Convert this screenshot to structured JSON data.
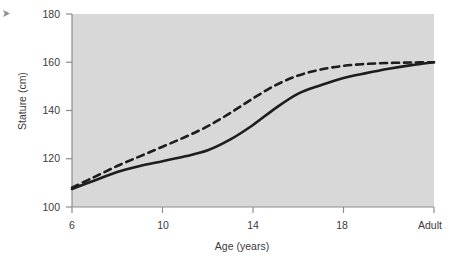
{
  "figure": {
    "corner_marker": "triangle-marker",
    "background_color": "#ffffff",
    "plot_background_color": "#d8d8d8",
    "axis_color": "#8d8d8d",
    "line_color": "#1d1d1d"
  },
  "chart_data": {
    "type": "line",
    "title": "",
    "xlabel": "Age (years)",
    "ylabel": "Stature (cm)",
    "xtick_labels": [
      "6",
      "10",
      "14",
      "18",
      "Adult"
    ],
    "xtick_values": [
      6,
      10,
      14,
      18,
      22
    ],
    "ytick_labels": [
      "100",
      "120",
      "140",
      "160",
      "180"
    ],
    "ytick_values": [
      100,
      120,
      140,
      160,
      180
    ],
    "xlim": [
      6,
      22
    ],
    "ylim": [
      100,
      180
    ],
    "grid": false,
    "legend_position": "inline-annotations",
    "series": [
      {
        "name": "Sea level",
        "style": "dashed",
        "label_position": {
          "x": 176,
          "y": 88
        },
        "x": [
          6,
          7,
          8,
          9,
          10,
          11,
          12,
          13,
          14,
          15,
          16,
          17,
          18,
          19,
          20,
          21,
          22
        ],
        "values": [
          108.0,
          112.5,
          117.0,
          121.0,
          125.0,
          129.0,
          133.5,
          139.0,
          145.0,
          150.5,
          154.5,
          157.0,
          158.5,
          159.3,
          159.7,
          159.9,
          160.0
        ]
      },
      {
        "name": "High altitude",
        "style": "solid",
        "label_position": {
          "x": 243,
          "y": 141
        },
        "x": [
          6,
          7,
          8,
          9,
          10,
          11,
          12,
          13,
          14,
          15,
          16,
          17,
          18,
          19,
          20,
          21,
          22
        ],
        "values": [
          107.5,
          111.0,
          114.5,
          117.0,
          119.0,
          121.0,
          123.5,
          128.0,
          134.0,
          141.0,
          147.0,
          150.5,
          153.5,
          155.5,
          157.3,
          158.8,
          160.0
        ]
      }
    ],
    "annotations": [
      {
        "text": "Sea level",
        "x": 176,
        "y": 88
      },
      {
        "text": "High altitude",
        "x": 243,
        "y": 141
      }
    ]
  }
}
